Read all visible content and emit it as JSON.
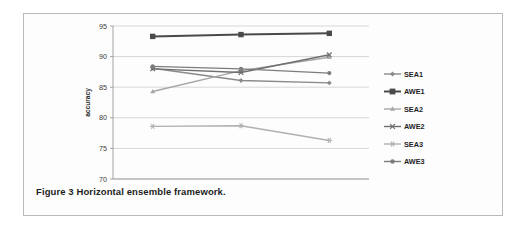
{
  "figure": {
    "caption": "Figure 3 Horizontal ensemble framework."
  },
  "chart_data": {
    "type": "line",
    "title": "",
    "xlabel": "",
    "ylabel": "accuracy",
    "categories": [
      "500",
      "1000",
      "2000"
    ],
    "x": [
      500,
      1000,
      2000
    ],
    "ylim": [
      70,
      95
    ],
    "yticks": [
      70,
      75,
      80,
      85,
      90,
      95
    ],
    "ytick_labels": [
      "70",
      "75",
      "80",
      "85",
      "90",
      "95"
    ],
    "xtick_labels": [
      "500",
      "1000",
      "2000"
    ],
    "grid": true,
    "legend_position": "right",
    "series": [
      {
        "name": "SEA1",
        "values": [
          88.1,
          86.1,
          85.7
        ],
        "marker": "diamond",
        "color": "#8a8a8a"
      },
      {
        "name": "AWE1",
        "values": [
          93.3,
          93.6,
          93.8
        ],
        "marker": "square",
        "color": "#4a4a4a"
      },
      {
        "name": "SEA2",
        "values": [
          84.3,
          87.7,
          89.9
        ],
        "marker": "triangle",
        "color": "#a6a6a6"
      },
      {
        "name": "AWE2",
        "values": [
          88.0,
          87.4,
          90.3
        ],
        "marker": "cross",
        "color": "#6f6f6f"
      },
      {
        "name": "SEA3",
        "values": [
          78.6,
          78.7,
          76.3
        ],
        "marker": "star",
        "color": "#b0b0b0"
      },
      {
        "name": "AWE3",
        "values": [
          88.4,
          88.0,
          87.3
        ],
        "marker": "circle",
        "color": "#7c7c7c"
      }
    ]
  }
}
